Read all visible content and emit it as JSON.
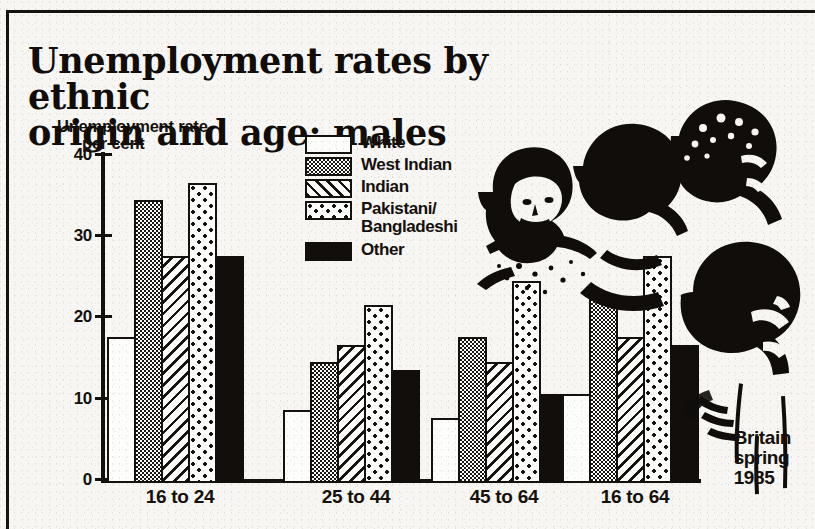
{
  "headline": {
    "line1": "Unemployment rates by ethnic",
    "line2": "origin and age: males"
  },
  "axis_title": {
    "line1": "Unemployment rate",
    "line2": "per cent"
  },
  "caption": {
    "line1": "Britain",
    "line2": "spring",
    "line3": "1985"
  },
  "legend": {
    "items": [
      {
        "label": "White",
        "pattern": "empty"
      },
      {
        "label": "West Indian",
        "pattern": "fine-stipple"
      },
      {
        "label": "Indian",
        "pattern": "diagonal-hatch"
      },
      {
        "label": "Pakistani/\nBangladeshi",
        "pattern": "coarse-dots"
      },
      {
        "label": "Other",
        "pattern": "solid-black"
      }
    ]
  },
  "yaxis": {
    "ticks": [
      "0",
      "10",
      "20",
      "30",
      "40"
    ]
  },
  "chart_data": {
    "type": "bar",
    "title": "Unemployment rates by ethnic origin and age: males",
    "subtitle": "Britain spring 1985",
    "xlabel": "",
    "ylabel": "Unemployment rate per cent",
    "ylim": [
      0,
      40
    ],
    "yticks": [
      0,
      10,
      20,
      30,
      40
    ],
    "grid": false,
    "legend_position": "top-center",
    "categories": [
      "16 to 24",
      "25 to 44",
      "45 to 64",
      "16 to 64"
    ],
    "series": [
      {
        "name": "White",
        "values": [
          18,
          9,
          8,
          11
        ]
      },
      {
        "name": "West Indian",
        "values": [
          35,
          15,
          18,
          23
        ]
      },
      {
        "name": "Indian",
        "values": [
          28,
          17,
          15,
          18
        ]
      },
      {
        "name": "Pakistani/Bangladeshi",
        "values": [
          37,
          22,
          25,
          28
        ]
      },
      {
        "name": "Other",
        "values": [
          28,
          14,
          11,
          17
        ]
      }
    ]
  },
  "colors": {
    "ink": "#15110e",
    "paper": "#f7f6f3"
  }
}
